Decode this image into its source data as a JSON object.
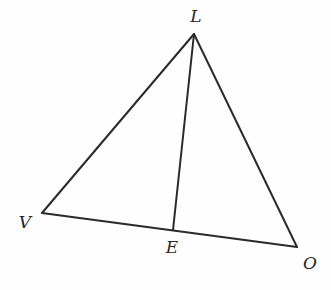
{
  "figure": {
    "kind": "geometry-diagram",
    "canvas": {
      "width": 331,
      "height": 290
    },
    "background_color": "#fefefe",
    "stroke_color": "#2a2a2e",
    "label_color": "#26262b",
    "stroke_width": 2
  },
  "points": [
    {
      "id": "L",
      "label": "L",
      "x": 194,
      "y": 34,
      "label_x": 196,
      "label_y": 16,
      "role": "apex-vertex"
    },
    {
      "id": "V",
      "label": "V",
      "x": 42,
      "y": 213,
      "label_x": 25,
      "label_y": 222,
      "role": "left-vertex"
    },
    {
      "id": "E",
      "label": "E",
      "x": 173,
      "y": 230,
      "label_x": 172,
      "label_y": 247,
      "role": "point-on-base"
    },
    {
      "id": "O",
      "label": "O",
      "x": 297,
      "y": 247,
      "label_x": 310,
      "label_y": 263,
      "role": "right-vertex"
    }
  ],
  "segments": [
    {
      "id": "VL",
      "name": "segment-v-l",
      "from": "V",
      "to": "L"
    },
    {
      "id": "LO",
      "name": "segment-l-o",
      "from": "L",
      "to": "O"
    },
    {
      "id": "VO",
      "name": "segment-v-o",
      "from": "V",
      "to": "O"
    },
    {
      "id": "LE",
      "name": "segment-l-e",
      "from": "L",
      "to": "E"
    }
  ]
}
